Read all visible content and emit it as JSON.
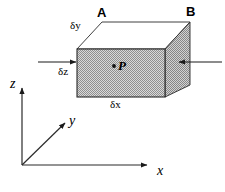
{
  "figure": {
    "type": "diagram",
    "background_color": "#ffffff",
    "line_color": "#000000",
    "fill_color": "#b8b8b8",
    "fill_pattern": "dithered-gray-checker"
  },
  "vertex_labels": [
    {
      "id": "A",
      "text": "A",
      "x": 97,
      "y": 6
    },
    {
      "id": "B",
      "text": "B",
      "x": 186,
      "y": 5
    }
  ],
  "dimension_labels": [
    {
      "id": "dy",
      "text": "δy",
      "x": 70,
      "y": 20
    },
    {
      "id": "dz",
      "text": "δz",
      "x": 58,
      "y": 66
    },
    {
      "id": "dx",
      "text": "δx",
      "x": 110,
      "y": 99
    }
  ],
  "point_label": {
    "id": "P",
    "text": "P",
    "dot_x": 114,
    "dot_y": 66,
    "x": 118,
    "y": 60
  },
  "axes": [
    {
      "id": "z",
      "label": "z",
      "label_x": 10,
      "label_y": 78,
      "from": [
        22,
        165
      ],
      "to": [
        22,
        86
      ]
    },
    {
      "id": "y",
      "label": "y",
      "label_x": 69,
      "label_y": 114,
      "from": [
        22,
        165
      ],
      "to": [
        66,
        122
      ]
    },
    {
      "id": "x",
      "label": "x",
      "label_x": 157,
      "label_y": 165,
      "from": [
        22,
        165
      ],
      "to": [
        148,
        165
      ]
    }
  ],
  "flow_arrows": [
    {
      "id": "inflow-left",
      "direction": "right",
      "from": [
        38,
        62
      ],
      "to": [
        77,
        62
      ]
    },
    {
      "id": "inflow-right",
      "direction": "left",
      "from": [
        222,
        62
      ],
      "to": [
        178,
        62
      ]
    }
  ],
  "box_geometry": {
    "front_face": [
      [
        77,
        49
      ],
      [
        165,
        49
      ],
      [
        165,
        97
      ],
      [
        77,
        97
      ]
    ],
    "top_face": [
      [
        77,
        49
      ],
      [
        102,
        22
      ],
      [
        190,
        22
      ],
      [
        165,
        49
      ]
    ],
    "side_face": [
      [
        165,
        49
      ],
      [
        190,
        22
      ],
      [
        190,
        85
      ],
      [
        165,
        97
      ]
    ]
  }
}
